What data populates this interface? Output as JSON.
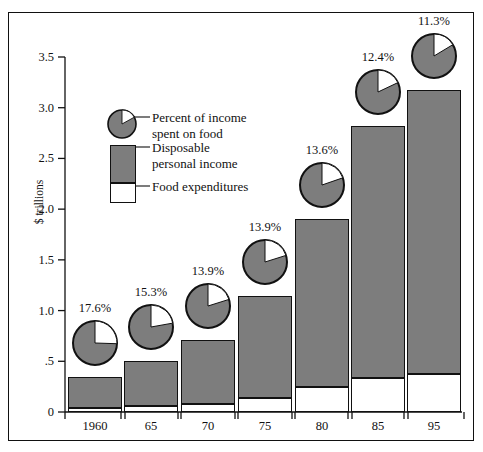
{
  "figure": {
    "background_color": "#ffffff",
    "frame_color": "#111111",
    "bar_fill_color": "#7d7d7d",
    "food_fill_color": "#ffffff"
  },
  "axes": {
    "ylabel": "$ trillions",
    "yticks": [
      "0",
      ".5",
      "1.0",
      "1.5",
      "2.0",
      "2.5",
      "3.0",
      "3.5"
    ],
    "ytick_values": [
      0,
      0.5,
      1.0,
      1.5,
      2.0,
      2.5,
      3.0,
      3.5
    ],
    "ylim": [
      0,
      3.5
    ],
    "xticks": [
      "1960",
      "65",
      "70",
      "75",
      "80",
      "85",
      "95"
    ]
  },
  "legend": {
    "pie_label": "Percent of income\nspent on food",
    "income_label": "Disposable\npersonal income",
    "food_label": "Food expenditures"
  },
  "chart_data": {
    "type": "bar",
    "title": "",
    "xlabel": "",
    "ylabel": "$ trillions",
    "ylim": [
      0,
      3.5
    ],
    "grid": false,
    "legend_position": "inside-upper-left",
    "stacked": true,
    "categories": [
      "1960",
      "65",
      "70",
      "75",
      "80",
      "85",
      "95"
    ],
    "series": [
      {
        "name": "Food expenditures",
        "values": [
          0.04,
          0.06,
          0.08,
          0.14,
          0.25,
          0.34,
          0.37
        ]
      },
      {
        "name": "Disposable personal income",
        "values": [
          0.35,
          0.5,
          0.71,
          1.14,
          1.9,
          2.82,
          3.17
        ]
      }
    ],
    "annotations": {
      "name": "Percent of income spent on food",
      "unit": "%",
      "values": [
        17.6,
        15.3,
        13.9,
        13.9,
        13.6,
        12.4,
        11.3
      ],
      "labels": [
        "17.6%",
        "15.3%",
        "13.9%",
        "13.9%",
        "13.6%",
        "12.4%",
        "11.3%"
      ]
    }
  },
  "bars": [
    {
      "year": "1960",
      "pct_label": "17.6%",
      "pct": 17.6,
      "total": 0.35,
      "food": 0.04
    },
    {
      "year": "65",
      "pct_label": "15.3%",
      "pct": 15.3,
      "total": 0.5,
      "food": 0.06
    },
    {
      "year": "70",
      "pct_label": "13.9%",
      "pct": 13.9,
      "total": 0.71,
      "food": 0.08
    },
    {
      "year": "75",
      "pct_label": "13.9%",
      "pct": 13.9,
      "total": 1.14,
      "food": 0.14
    },
    {
      "year": "80",
      "pct_label": "13.6%",
      "pct": 13.6,
      "total": 1.9,
      "food": 0.25
    },
    {
      "year": "85",
      "pct_label": "12.4%",
      "pct": 12.4,
      "total": 2.82,
      "food": 0.34
    },
    {
      "year": "95",
      "pct_label": "11.3%",
      "pct": 11.3,
      "total": 3.17,
      "food": 0.37
    }
  ]
}
